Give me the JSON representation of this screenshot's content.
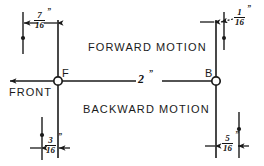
{
  "drawing": {
    "title": "Forward and backward motion dimension diagram",
    "ink_color": "#1a1a1a",
    "background": "#ffffff",
    "labels": {
      "forward_motion": "FORWARD MOTION",
      "backward_motion": "BACKWARD MOTION",
      "front": "FRONT",
      "point_f": "F",
      "point_b": "B"
    },
    "dimensions": [
      {
        "name": "top-left-clearance",
        "numerator": "7",
        "denominator": "16",
        "unit": "”",
        "position": "top-left"
      },
      {
        "name": "top-right-clearance",
        "numerator": "1",
        "denominator": "16",
        "unit": "”",
        "position": "top-right"
      },
      {
        "name": "center-span",
        "value": "2",
        "unit": "”",
        "position": "center"
      },
      {
        "name": "bottom-left-clearance",
        "numerator": "3",
        "denominator": "16",
        "unit": "”",
        "position": "bottom-left"
      },
      {
        "name": "bottom-right-clearance",
        "numerator": "5",
        "denominator": "16",
        "unit": "”",
        "position": "bottom-right"
      }
    ]
  }
}
